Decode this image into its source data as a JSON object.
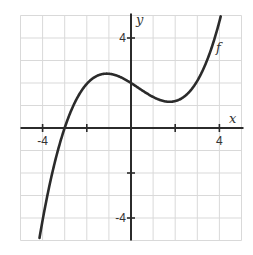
{
  "chart_data": {
    "type": "line",
    "title": "",
    "xlabel": "x",
    "ylabel": "y",
    "xlim": [
      -5,
      5
    ],
    "ylim": [
      -5,
      5
    ],
    "grid": true,
    "x_tick_labels": [
      {
        "value": -4,
        "label": "-4"
      },
      {
        "value": 4,
        "label": "4"
      }
    ],
    "y_tick_labels": [
      {
        "value": 4,
        "label": "4"
      },
      {
        "value": -4,
        "label": "-4"
      }
    ],
    "x_ticks": [
      -4,
      -2,
      2,
      4
    ],
    "y_ticks": [
      4,
      -2,
      -4
    ],
    "series": [
      {
        "name": "f",
        "label": "f",
        "function": "cubic",
        "key_points": [
          {
            "x": -4.28,
            "y": -5.0
          },
          {
            "x": -3.0,
            "y": 0.0
          },
          {
            "x": -1.1,
            "y": 2.43
          },
          {
            "x": 0.0,
            "y": 2.0
          },
          {
            "x": 1.75,
            "y": 1.15
          },
          {
            "x": 4.2,
            "y": 5.0
          }
        ],
        "color": "#2b2b2b"
      }
    ],
    "annotations": [
      {
        "text": "f",
        "x": 4.0,
        "y": 3.8
      }
    ]
  },
  "axes": {
    "x_label": "x",
    "y_label": "y",
    "curve_label": "f"
  },
  "colors": {
    "grid": "#d9d9d9",
    "axis": "#2b2b2b",
    "curve": "#2b2b2b"
  }
}
